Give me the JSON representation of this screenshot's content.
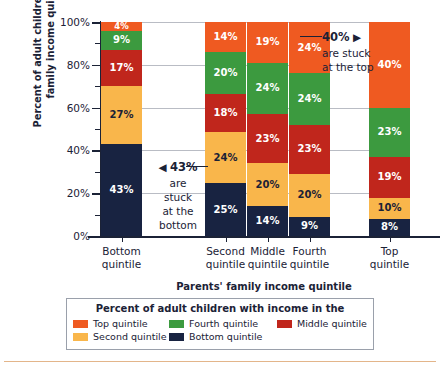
{
  "chart_data": {
    "type": "bar",
    "stacked": true,
    "stacked_normalized": true,
    "title": "",
    "xlabel": "Parents' family income quintile",
    "ylabel": "Percent of adult children in each family income quintile",
    "ylim": [
      0,
      100
    ],
    "yticks": [
      0,
      20,
      40,
      60,
      80,
      100
    ],
    "ytick_labels": [
      "0%",
      "20%",
      "40%",
      "60%",
      "80%",
      "100%"
    ],
    "yminor_ticks": [
      10,
      30,
      50,
      70,
      90
    ],
    "grid": true,
    "grid_axis": "y",
    "legend_position": "bottom",
    "legend_title": "Percent of adult children with income in the",
    "categories": [
      "Bottom quintile",
      "Second quintile",
      "Middle quintile",
      "Fourth quintile",
      "Top quintile"
    ],
    "series": [
      {
        "name": "Bottom quintile",
        "color": "#182341",
        "values": [
          43,
          25,
          14,
          9,
          8
        ]
      },
      {
        "name": "Second quintile",
        "color": "#f9b64b",
        "values": [
          27,
          24,
          20,
          20,
          10
        ]
      },
      {
        "name": "Middle quintile",
        "color": "#c0261c",
        "values": [
          17,
          18,
          23,
          23,
          19
        ]
      },
      {
        "name": "Fourth quintile",
        "color": "#3c9a3f",
        "values": [
          9,
          20,
          24,
          24,
          23
        ]
      },
      {
        "name": "Top quintile",
        "color": "#ef5a21",
        "values": [
          4,
          14,
          19,
          24,
          40
        ]
      }
    ],
    "annotations": [
      {
        "id": "stuck-at-the-bottom",
        "value_label": "43%",
        "arrow": "◀",
        "lines": [
          "are",
          "stuck",
          "at the",
          "bottom"
        ],
        "points_to": "Bottom quintile / Bottom quintile segment"
      },
      {
        "id": "stuck-at-the-top",
        "value_label": "40%",
        "arrow": "▶",
        "lines": [
          "are stuck",
          "at the top"
        ],
        "points_to": "Top quintile / Top quintile segment"
      }
    ]
  },
  "axis": {
    "y_title": "Percent of adult children in each family income quintile",
    "x_title": "Parents' family income quintile",
    "ytick_labels": [
      "100%",
      "80%",
      "60%",
      "40%",
      "20%",
      "0%"
    ],
    "xtick_labels": [
      {
        "line1": "Bottom",
        "line2": "quintile"
      },
      {
        "line1": "Second",
        "line2": "quintile"
      },
      {
        "line1": "Middle",
        "line2": "quintile"
      },
      {
        "line1": "Fourth",
        "line2": "quintile"
      },
      {
        "line1": "Top",
        "line2": "quintile"
      }
    ]
  },
  "bars": [
    {
      "name": "bottom-quintile",
      "segments": [
        {
          "label": "43%",
          "value": 43,
          "color": "#182341",
          "text": "light"
        },
        {
          "label": "27%",
          "value": 27,
          "color": "#f9b64b",
          "text": "dark"
        },
        {
          "label": "17%",
          "value": 17,
          "color": "#c0261c",
          "text": "light"
        },
        {
          "label": "9%",
          "value": 9,
          "color": "#3c9a3f",
          "text": "light"
        },
        {
          "label": "4%",
          "value": 4,
          "color": "#ef5a21",
          "text": "light"
        }
      ]
    },
    {
      "name": "second-quintile",
      "segments": [
        {
          "label": "25%",
          "value": 25,
          "color": "#182341",
          "text": "light"
        },
        {
          "label": "24%",
          "value": 24,
          "color": "#f9b64b",
          "text": "dark"
        },
        {
          "label": "18%",
          "value": 18,
          "color": "#c0261c",
          "text": "light"
        },
        {
          "label": "20%",
          "value": 20,
          "color": "#3c9a3f",
          "text": "light"
        },
        {
          "label": "14%",
          "value": 14,
          "color": "#ef5a21",
          "text": "light"
        }
      ]
    },
    {
      "name": "middle-quintile",
      "segments": [
        {
          "label": "14%",
          "value": 14,
          "color": "#182341",
          "text": "light"
        },
        {
          "label": "20%",
          "value": 20,
          "color": "#f9b64b",
          "text": "dark"
        },
        {
          "label": "23%",
          "value": 23,
          "color": "#c0261c",
          "text": "light"
        },
        {
          "label": "24%",
          "value": 24,
          "color": "#3c9a3f",
          "text": "light"
        },
        {
          "label": "19%",
          "value": 19,
          "color": "#ef5a21",
          "text": "light"
        }
      ]
    },
    {
      "name": "fourth-quintile",
      "segments": [
        {
          "label": "9%",
          "value": 9,
          "color": "#182341",
          "text": "light"
        },
        {
          "label": "20%",
          "value": 20,
          "color": "#f9b64b",
          "text": "dark"
        },
        {
          "label": "23%",
          "value": 23,
          "color": "#c0261c",
          "text": "light"
        },
        {
          "label": "24%",
          "value": 24,
          "color": "#3c9a3f",
          "text": "light"
        },
        {
          "label": "24%",
          "value": 24,
          "color": "#ef5a21",
          "text": "light"
        }
      ]
    },
    {
      "name": "top-quintile",
      "segments": [
        {
          "label": "8%",
          "value": 8,
          "color": "#182341",
          "text": "light"
        },
        {
          "label": "10%",
          "value": 10,
          "color": "#f9b64b",
          "text": "dark"
        },
        {
          "label": "19%",
          "value": 19,
          "color": "#c0261c",
          "text": "light"
        },
        {
          "label": "23%",
          "value": 23,
          "color": "#3c9a3f",
          "text": "light"
        },
        {
          "label": "40%",
          "value": 40,
          "color": "#ef5a21",
          "text": "light"
        }
      ]
    }
  ],
  "annotations": {
    "bottom": {
      "value": "43%",
      "arrow": "◀",
      "l1": "are",
      "l2": "stuck",
      "l3": "at the",
      "l4": "bottom"
    },
    "top": {
      "value": "40%",
      "arrow": "▶",
      "l1": "are stuck",
      "l2": "at the top"
    }
  },
  "legend": {
    "title": "Percent of adult children with income in the",
    "items": [
      {
        "label": "Top quintile",
        "color": "#ef5a21"
      },
      {
        "label": "Fourth quintile",
        "color": "#3c9a3f"
      },
      {
        "label": "Middle quintile",
        "color": "#c0261c"
      },
      {
        "label": "Second quintile",
        "color": "#f9b64b"
      },
      {
        "label": "Bottom quintile",
        "color": "#182341"
      }
    ]
  },
  "colors": {
    "top": "#ef5a21",
    "fourth": "#3c9a3f",
    "middle": "#c0261c",
    "second": "#f9b64b",
    "bottom": "#182341",
    "axis": "#1b2236",
    "grid": "#b9bcc4",
    "rule": "#e3b58a"
  }
}
